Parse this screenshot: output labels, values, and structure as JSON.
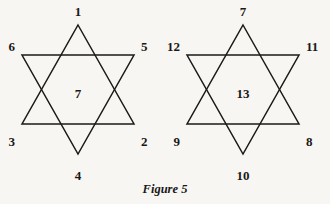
{
  "figure": {
    "caption": "Figure 5",
    "caption_x": 165,
    "caption_y": 193,
    "background_color": "#f7f6f3",
    "ink_color": "#1b1a18",
    "stroke_width": 1.5,
    "width": 330,
    "height": 204
  },
  "chart_data": {
    "type": "diagram",
    "title": "Figure 5",
    "subtitle": "",
    "shapes": [
      {
        "name": "left-hexagram",
        "center_value": "7",
        "points": [
          {
            "label": "1",
            "position": "top"
          },
          {
            "label": "5",
            "position": "upper-right"
          },
          {
            "label": "2",
            "position": "lower-right"
          },
          {
            "label": "4",
            "position": "bottom"
          },
          {
            "label": "3",
            "position": "lower-left"
          },
          {
            "label": "6",
            "position": "upper-left"
          }
        ],
        "triangles": [
          {
            "name": "apex-up",
            "vertices": [
              "1",
              "2",
              "3"
            ]
          },
          {
            "name": "apex-down",
            "vertices": [
              "6",
              "5",
              "4"
            ]
          }
        ]
      },
      {
        "name": "right-hexagram",
        "center_value": "13",
        "points": [
          {
            "label": "7",
            "position": "top"
          },
          {
            "label": "11",
            "position": "upper-right"
          },
          {
            "label": "8",
            "position": "lower-right"
          },
          {
            "label": "10",
            "position": "bottom"
          },
          {
            "label": "9",
            "position": "lower-left"
          },
          {
            "label": "12",
            "position": "upper-left"
          }
        ],
        "triangles": [
          {
            "name": "apex-up",
            "vertices": [
              "7",
              "8",
              "9"
            ]
          },
          {
            "name": "apex-down",
            "vertices": [
              "12",
              "11",
              "10"
            ]
          }
        ]
      }
    ]
  },
  "left_star": {
    "up_triangle_path": "M 78,25 L 134,124 L 22,124 Z",
    "down_triangle_path": "M 22,55 L 134,55 L 78,154 Z",
    "center": {
      "value": "7",
      "x": 78,
      "y": 95
    },
    "labels": {
      "top": {
        "value": "1",
        "x": 78,
        "y": 16,
        "anchor": "middle"
      },
      "upper_right": {
        "value": "5",
        "x": 141,
        "y": 51,
        "anchor": "start"
      },
      "lower_right": {
        "value": "2",
        "x": 141,
        "y": 146,
        "anchor": "start"
      },
      "bottom": {
        "value": "4",
        "x": 78,
        "y": 180,
        "anchor": "middle"
      },
      "lower_left": {
        "value": "3",
        "x": 15,
        "y": 146,
        "anchor": "end"
      },
      "upper_left": {
        "value": "6",
        "x": 15,
        "y": 51,
        "anchor": "end"
      }
    }
  },
  "right_star": {
    "up_triangle_path": "M 243,25 L 299,124 L 187,124 Z",
    "down_triangle_path": "M 187,55 L 299,55 L 243,154 Z",
    "center": {
      "value": "13",
      "x": 243,
      "y": 95
    },
    "labels": {
      "top": {
        "value": "7",
        "x": 243,
        "y": 16,
        "anchor": "middle"
      },
      "upper_right": {
        "value": "11",
        "x": 306,
        "y": 51,
        "anchor": "start"
      },
      "lower_right": {
        "value": "8",
        "x": 306,
        "y": 146,
        "anchor": "start"
      },
      "bottom": {
        "value": "10",
        "x": 243,
        "y": 180,
        "anchor": "middle"
      },
      "lower_left": {
        "value": "9",
        "x": 180,
        "y": 146,
        "anchor": "end"
      },
      "upper_left": {
        "value": "12",
        "x": 180,
        "y": 51,
        "anchor": "end"
      }
    }
  }
}
